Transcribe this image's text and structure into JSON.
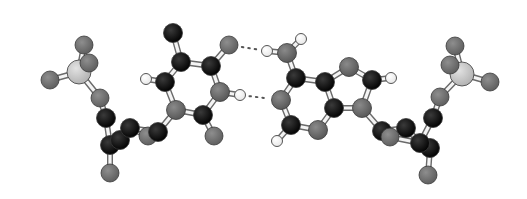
{
  "figure": {
    "width": 527,
    "height": 199,
    "background": "#ffffff"
  },
  "colors": {
    "C": "#0a0a0a",
    "N": "#6e6e6e",
    "O": "#777777",
    "P": "#c9c9c9",
    "H": "#ffffff",
    "bond_fill": "#f4f4f4",
    "bond_edge": "#6a6a6a",
    "atom_edge": "#3a3a3a",
    "hbond": "#555555"
  },
  "radii": {
    "C": 9.5,
    "N": 9.5,
    "O": 9,
    "P": 12,
    "H": 5.5
  },
  "atoms": [
    {
      "id": "LP",
      "el": "P",
      "x": 79,
      "y": 72
    },
    {
      "id": "LO1",
      "el": "O",
      "x": 84,
      "y": 45
    },
    {
      "id": "LO2",
      "el": "O",
      "x": 89,
      "y": 63
    },
    {
      "id": "LO3",
      "el": "O",
      "x": 50,
      "y": 80
    },
    {
      "id": "LO5",
      "el": "O",
      "x": 100,
      "y": 98
    },
    {
      "id": "LC5p",
      "el": "C",
      "x": 106,
      "y": 118
    },
    {
      "id": "LC3p",
      "el": "C",
      "x": 110,
      "y": 145
    },
    {
      "id": "LC2p",
      "el": "C",
      "x": 120,
      "y": 140
    },
    {
      "id": "LC4p",
      "el": "C",
      "x": 130,
      "y": 128
    },
    {
      "id": "LO4p",
      "el": "O",
      "x": 148,
      "y": 136
    },
    {
      "id": "LC1p",
      "el": "C",
      "x": 158,
      "y": 132
    },
    {
      "id": "LO3p",
      "el": "O",
      "x": 110,
      "y": 173
    },
    {
      "id": "UN1",
      "el": "N",
      "x": 176,
      "y": 110
    },
    {
      "id": "UC6",
      "el": "C",
      "x": 165,
      "y": 82
    },
    {
      "id": "UH6",
      "el": "H",
      "x": 146,
      "y": 79
    },
    {
      "id": "UC5",
      "el": "C",
      "x": 181,
      "y": 62
    },
    {
      "id": "UC7",
      "el": "C",
      "x": 173,
      "y": 33
    },
    {
      "id": "UC4",
      "el": "C",
      "x": 211,
      "y": 66
    },
    {
      "id": "UO4",
      "el": "O",
      "x": 229,
      "y": 45
    },
    {
      "id": "UN3",
      "el": "N",
      "x": 220,
      "y": 92
    },
    {
      "id": "UH3",
      "el": "H",
      "x": 240,
      "y": 95
    },
    {
      "id": "UC2",
      "el": "C",
      "x": 203,
      "y": 115
    },
    {
      "id": "UO2",
      "el": "O",
      "x": 214,
      "y": 136
    },
    {
      "id": "AH61",
      "el": "H",
      "x": 267,
      "y": 51
    },
    {
      "id": "AN6",
      "el": "N",
      "x": 287,
      "y": 53
    },
    {
      "id": "AH62",
      "el": "H",
      "x": 301,
      "y": 39
    },
    {
      "id": "AC6",
      "el": "C",
      "x": 296,
      "y": 78
    },
    {
      "id": "AN1",
      "el": "N",
      "x": 281,
      "y": 100
    },
    {
      "id": "AC2",
      "el": "C",
      "x": 291,
      "y": 125
    },
    {
      "id": "AH2",
      "el": "H",
      "x": 277,
      "y": 141
    },
    {
      "id": "AN3",
      "el": "N",
      "x": 318,
      "y": 130
    },
    {
      "id": "AC4",
      "el": "C",
      "x": 334,
      "y": 108
    },
    {
      "id": "AC5",
      "el": "C",
      "x": 325,
      "y": 82
    },
    {
      "id": "AN7",
      "el": "N",
      "x": 349,
      "y": 67
    },
    {
      "id": "AC8",
      "el": "C",
      "x": 372,
      "y": 80
    },
    {
      "id": "AH8",
      "el": "H",
      "x": 391,
      "y": 78
    },
    {
      "id": "AN9",
      "el": "N",
      "x": 362,
      "y": 108
    },
    {
      "id": "RC1p",
      "el": "C",
      "x": 382,
      "y": 131
    },
    {
      "id": "RC2p",
      "el": "C",
      "x": 406,
      "y": 128
    },
    {
      "id": "RO4p",
      "el": "O",
      "x": 390,
      "y": 137
    },
    {
      "id": "RC3p",
      "el": "C",
      "x": 420,
      "y": 143
    },
    {
      "id": "RC4p",
      "el": "C",
      "x": 430,
      "y": 148
    },
    {
      "id": "RO3p",
      "el": "O",
      "x": 428,
      "y": 175
    },
    {
      "id": "RC5p",
      "el": "C",
      "x": 433,
      "y": 118
    },
    {
      "id": "RO5",
      "el": "O",
      "x": 440,
      "y": 97
    },
    {
      "id": "RP",
      "el": "P",
      "x": 462,
      "y": 74
    },
    {
      "id": "RO1",
      "el": "O",
      "x": 455,
      "y": 46
    },
    {
      "id": "RO2",
      "el": "O",
      "x": 450,
      "y": 65
    },
    {
      "id": "RO3",
      "el": "O",
      "x": 490,
      "y": 82
    }
  ],
  "bonds": [
    [
      "LP",
      "LO1"
    ],
    [
      "LP",
      "LO2"
    ],
    [
      "LP",
      "LO3"
    ],
    [
      "LP",
      "LO5"
    ],
    [
      "LO5",
      "LC5p"
    ],
    [
      "LC5p",
      "LC3p"
    ],
    [
      "LC3p",
      "LO3p"
    ],
    [
      "LC3p",
      "LC2p"
    ],
    [
      "LC2p",
      "LC4p"
    ],
    [
      "LC4p",
      "LO4p"
    ],
    [
      "LO4p",
      "LC1p"
    ],
    [
      "LC4p",
      "LC1p"
    ],
    [
      "LC1p",
      "UN1"
    ],
    [
      "UN1",
      "UC6"
    ],
    [
      "UC6",
      "UH6"
    ],
    [
      "UC6",
      "UC5"
    ],
    [
      "UC5",
      "UC7"
    ],
    [
      "UC5",
      "UC4"
    ],
    [
      "UC4",
      "UO4"
    ],
    [
      "UC4",
      "UN3"
    ],
    [
      "UN3",
      "UH3"
    ],
    [
      "UN3",
      "UC2"
    ],
    [
      "UC2",
      "UN1"
    ],
    [
      "UC2",
      "UO2"
    ],
    [
      "AN6",
      "AH61"
    ],
    [
      "AN6",
      "AH62"
    ],
    [
      "AN6",
      "AC6"
    ],
    [
      "AC6",
      "AN1"
    ],
    [
      "AN1",
      "AC2"
    ],
    [
      "AC2",
      "AH2"
    ],
    [
      "AC2",
      "AN3"
    ],
    [
      "AN3",
      "AC4"
    ],
    [
      "AC4",
      "AC5"
    ],
    [
      "AC5",
      "AC6"
    ],
    [
      "AC5",
      "AN7"
    ],
    [
      "AN7",
      "AC8"
    ],
    [
      "AC8",
      "AH8"
    ],
    [
      "AC8",
      "AN9"
    ],
    [
      "AN9",
      "AC4"
    ],
    [
      "AN9",
      "RC1p"
    ],
    [
      "RC1p",
      "RO4p"
    ],
    [
      "RC1p",
      "RC2p"
    ],
    [
      "RC2p",
      "RC3p"
    ],
    [
      "RO4p",
      "RC3p"
    ],
    [
      "RC3p",
      "RC4p"
    ],
    [
      "RC4p",
      "RO3p"
    ],
    [
      "RC3p",
      "RC5p"
    ],
    [
      "RC5p",
      "RO5"
    ],
    [
      "RO5",
      "RP"
    ],
    [
      "RP",
      "RO1"
    ],
    [
      "RP",
      "RO2"
    ],
    [
      "RP",
      "RO3"
    ]
  ],
  "hbonds": [
    {
      "from": "UO4",
      "to": "AH61",
      "label": "O4···H-N6"
    },
    {
      "from": "UH3",
      "to": "AN1",
      "label": "N3-H···N1"
    }
  ],
  "draw_order": [
    "LO3p",
    "LC3p",
    "LC2p",
    "LO4p",
    "LC4p",
    "LC1p",
    "LC5p",
    "LO5",
    "LO3",
    "LP",
    "LO2",
    "LO1",
    "UO2",
    "UC2",
    "UN1",
    "UH6",
    "UC6",
    "UC5",
    "UC7",
    "UC4",
    "UO4",
    "UH3",
    "UN3",
    "AH2",
    "AC2",
    "AN3",
    "AN1",
    "AC4",
    "AC6",
    "AN6",
    "AH61",
    "AH62",
    "AC5",
    "AN7",
    "AC8",
    "AH8",
    "AN9",
    "RO3p",
    "RC4p",
    "RC3p",
    "RC2p",
    "RC1p",
    "RO4p",
    "RC5p",
    "RO5",
    "RP",
    "RO3",
    "RO2",
    "RO1"
  ]
}
